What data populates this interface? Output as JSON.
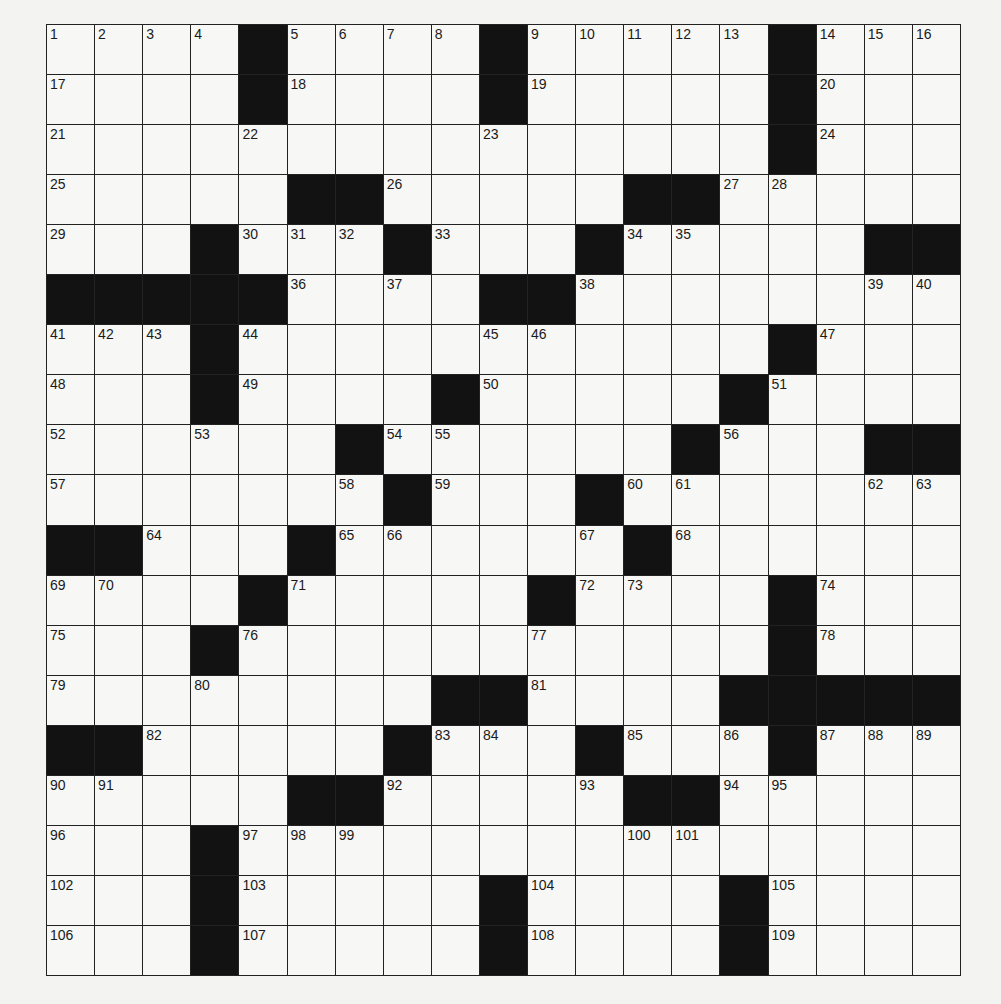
{
  "puzzle": {
    "rows": 19,
    "cols": 19,
    "colors": {
      "background": "#f3f3f1",
      "cell": "#f7f7f5",
      "block": "#121212",
      "line": "#222222",
      "number": "#1a1a1a"
    },
    "layout": [
      "....#....#.....#...",
      "....#....#.....#...",
      "...............#...",
      ".....##.....##.....",
      "...#...#...#.....##",
      "#####....##........",
      "...#...........#...",
      "...#....#.....#....",
      "......#......#...##",
      ".......#...#.......",
      "##...#......#......",
      "....#.....#....#...",
      "...#...........#...",
      "........##....#####",
      "##.....#...#...#...",
      ".....##.....##.....",
      "...#...............",
      "...#.....#....#....",
      "...#.....#....#...."
    ],
    "numbers": [
      {
        "r": 0,
        "c": 0,
        "n": "1"
      },
      {
        "r": 0,
        "c": 1,
        "n": "2"
      },
      {
        "r": 0,
        "c": 2,
        "n": "3"
      },
      {
        "r": 0,
        "c": 3,
        "n": "4"
      },
      {
        "r": 0,
        "c": 5,
        "n": "5"
      },
      {
        "r": 0,
        "c": 6,
        "n": "6"
      },
      {
        "r": 0,
        "c": 7,
        "n": "7"
      },
      {
        "r": 0,
        "c": 8,
        "n": "8"
      },
      {
        "r": 0,
        "c": 10,
        "n": "9"
      },
      {
        "r": 0,
        "c": 11,
        "n": "10"
      },
      {
        "r": 0,
        "c": 12,
        "n": "11"
      },
      {
        "r": 0,
        "c": 13,
        "n": "12"
      },
      {
        "r": 0,
        "c": 14,
        "n": "13"
      },
      {
        "r": 0,
        "c": 16,
        "n": "14"
      },
      {
        "r": 0,
        "c": 17,
        "n": "15"
      },
      {
        "r": 0,
        "c": 18,
        "n": "16"
      },
      {
        "r": 1,
        "c": 0,
        "n": "17"
      },
      {
        "r": 1,
        "c": 5,
        "n": "18"
      },
      {
        "r": 1,
        "c": 10,
        "n": "19"
      },
      {
        "r": 1,
        "c": 16,
        "n": "20"
      },
      {
        "r": 2,
        "c": 0,
        "n": "21"
      },
      {
        "r": 2,
        "c": 4,
        "n": "22"
      },
      {
        "r": 2,
        "c": 9,
        "n": "23"
      },
      {
        "r": 2,
        "c": 16,
        "n": "24"
      },
      {
        "r": 3,
        "c": 0,
        "n": "25"
      },
      {
        "r": 3,
        "c": 7,
        "n": "26"
      },
      {
        "r": 3,
        "c": 14,
        "n": "27"
      },
      {
        "r": 3,
        "c": 15,
        "n": "28"
      },
      {
        "r": 4,
        "c": 0,
        "n": "29"
      },
      {
        "r": 4,
        "c": 4,
        "n": "30"
      },
      {
        "r": 4,
        "c": 5,
        "n": "31"
      },
      {
        "r": 4,
        "c": 6,
        "n": "32"
      },
      {
        "r": 4,
        "c": 8,
        "n": "33"
      },
      {
        "r": 4,
        "c": 12,
        "n": "34"
      },
      {
        "r": 4,
        "c": 13,
        "n": "35"
      },
      {
        "r": 5,
        "c": 5,
        "n": "36"
      },
      {
        "r": 5,
        "c": 7,
        "n": "37"
      },
      {
        "r": 5,
        "c": 11,
        "n": "38"
      },
      {
        "r": 5,
        "c": 17,
        "n": "39"
      },
      {
        "r": 5,
        "c": 18,
        "n": "40"
      },
      {
        "r": 6,
        "c": 0,
        "n": "41"
      },
      {
        "r": 6,
        "c": 1,
        "n": "42"
      },
      {
        "r": 6,
        "c": 2,
        "n": "43"
      },
      {
        "r": 6,
        "c": 4,
        "n": "44"
      },
      {
        "r": 6,
        "c": 9,
        "n": "45"
      },
      {
        "r": 6,
        "c": 10,
        "n": "46"
      },
      {
        "r": 6,
        "c": 16,
        "n": "47"
      },
      {
        "r": 7,
        "c": 0,
        "n": "48"
      },
      {
        "r": 7,
        "c": 4,
        "n": "49"
      },
      {
        "r": 7,
        "c": 9,
        "n": "50"
      },
      {
        "r": 7,
        "c": 15,
        "n": "51"
      },
      {
        "r": 8,
        "c": 0,
        "n": "52"
      },
      {
        "r": 8,
        "c": 3,
        "n": "53"
      },
      {
        "r": 8,
        "c": 7,
        "n": "54"
      },
      {
        "r": 8,
        "c": 8,
        "n": "55"
      },
      {
        "r": 8,
        "c": 14,
        "n": "56"
      },
      {
        "r": 9,
        "c": 0,
        "n": "57"
      },
      {
        "r": 9,
        "c": 6,
        "n": "58"
      },
      {
        "r": 9,
        "c": 8,
        "n": "59"
      },
      {
        "r": 9,
        "c": 12,
        "n": "60"
      },
      {
        "r": 9,
        "c": 13,
        "n": "61"
      },
      {
        "r": 9,
        "c": 17,
        "n": "62"
      },
      {
        "r": 9,
        "c": 18,
        "n": "63"
      },
      {
        "r": 10,
        "c": 2,
        "n": "64"
      },
      {
        "r": 10,
        "c": 6,
        "n": "65"
      },
      {
        "r": 10,
        "c": 7,
        "n": "66"
      },
      {
        "r": 10,
        "c": 11,
        "n": "67"
      },
      {
        "r": 10,
        "c": 13,
        "n": "68"
      },
      {
        "r": 11,
        "c": 0,
        "n": "69"
      },
      {
        "r": 11,
        "c": 1,
        "n": "70"
      },
      {
        "r": 11,
        "c": 5,
        "n": "71"
      },
      {
        "r": 11,
        "c": 11,
        "n": "72"
      },
      {
        "r": 11,
        "c": 12,
        "n": "73"
      },
      {
        "r": 11,
        "c": 16,
        "n": "74"
      },
      {
        "r": 12,
        "c": 0,
        "n": "75"
      },
      {
        "r": 12,
        "c": 4,
        "n": "76"
      },
      {
        "r": 12,
        "c": 10,
        "n": "77"
      },
      {
        "r": 12,
        "c": 16,
        "n": "78"
      },
      {
        "r": 13,
        "c": 0,
        "n": "79"
      },
      {
        "r": 13,
        "c": 3,
        "n": "80"
      },
      {
        "r": 13,
        "c": 10,
        "n": "81"
      },
      {
        "r": 14,
        "c": 2,
        "n": "82"
      },
      {
        "r": 14,
        "c": 8,
        "n": "83"
      },
      {
        "r": 14,
        "c": 9,
        "n": "84"
      },
      {
        "r": 14,
        "c": 12,
        "n": "85"
      },
      {
        "r": 14,
        "c": 14,
        "n": "86"
      },
      {
        "r": 14,
        "c": 16,
        "n": "87"
      },
      {
        "r": 14,
        "c": 17,
        "n": "88"
      },
      {
        "r": 14,
        "c": 18,
        "n": "89"
      },
      {
        "r": 15,
        "c": 0,
        "n": "90"
      },
      {
        "r": 15,
        "c": 1,
        "n": "91"
      },
      {
        "r": 15,
        "c": 7,
        "n": "92"
      },
      {
        "r": 15,
        "c": 11,
        "n": "93"
      },
      {
        "r": 15,
        "c": 14,
        "n": "94"
      },
      {
        "r": 15,
        "c": 15,
        "n": "95"
      },
      {
        "r": 16,
        "c": 0,
        "n": "96"
      },
      {
        "r": 16,
        "c": 4,
        "n": "97"
      },
      {
        "r": 16,
        "c": 5,
        "n": "98"
      },
      {
        "r": 16,
        "c": 6,
        "n": "99"
      },
      {
        "r": 16,
        "c": 12,
        "n": "100"
      },
      {
        "r": 16,
        "c": 13,
        "n": "101"
      },
      {
        "r": 17,
        "c": 0,
        "n": "102"
      },
      {
        "r": 17,
        "c": 4,
        "n": "103"
      },
      {
        "r": 17,
        "c": 10,
        "n": "104"
      },
      {
        "r": 17,
        "c": 15,
        "n": "105"
      },
      {
        "r": 18,
        "c": 0,
        "n": "106"
      },
      {
        "r": 18,
        "c": 4,
        "n": "107"
      },
      {
        "r": 18,
        "c": 10,
        "n": "108"
      },
      {
        "r": 18,
        "c": 15,
        "n": "109"
      }
    ],
    "entries": []
  }
}
